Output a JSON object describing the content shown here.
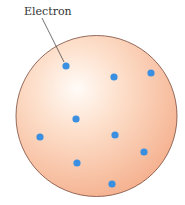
{
  "diagram": {
    "title": "",
    "label": "Electron",
    "sphere": {
      "cx": 96.5,
      "cy": 116,
      "r": 80.5,
      "fill_center": "#fffaf5",
      "fill_mid": "#fbd3b8",
      "fill_edge": "#f5b08e",
      "stroke": "#7a4a3a"
    },
    "electron_color": "#3a8fe0",
    "electrons": [
      {
        "x": 66,
        "y": 66
      },
      {
        "x": 114,
        "y": 77
      },
      {
        "x": 151,
        "y": 73
      },
      {
        "x": 76,
        "y": 119
      },
      {
        "x": 40,
        "y": 137
      },
      {
        "x": 115,
        "y": 135
      },
      {
        "x": 144,
        "y": 152
      },
      {
        "x": 77,
        "y": 163
      },
      {
        "x": 112,
        "y": 184
      }
    ],
    "leader_line": {
      "x1": 42,
      "y1": 18,
      "x2": 64,
      "y2": 62
    }
  }
}
